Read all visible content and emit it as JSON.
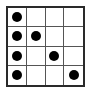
{
  "diagram": {
    "type": "grid",
    "rows": 4,
    "cols": 4,
    "dot_color": "#000000",
    "line_color": "#555555",
    "dots": [
      {
        "row": 0,
        "col": 0
      },
      {
        "row": 1,
        "col": 0
      },
      {
        "row": 1,
        "col": 1
      },
      {
        "row": 2,
        "col": 0
      },
      {
        "row": 2,
        "col": 2
      },
      {
        "row": 3,
        "col": 0
      },
      {
        "row": 3,
        "col": 3
      }
    ]
  }
}
